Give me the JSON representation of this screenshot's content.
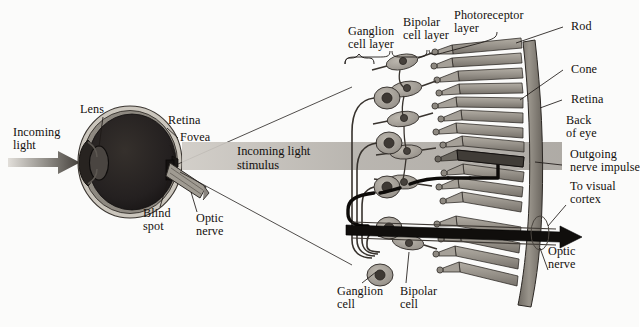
{
  "figure": {
    "background_color": "#fbfbfa",
    "ink_color": "#14100d"
  },
  "eye": {
    "labels": {
      "incoming_light": "Incoming\nlight",
      "lens": "Lens",
      "retina": "Retina",
      "fovea": "Fovea",
      "blind_spot": "Blind\nspot",
      "optic_nerve": "Optic\nnerve"
    },
    "colors": {
      "sclera": "#b9b4ab",
      "vitreous": "#231f1d",
      "lens_fill": "#3b3633",
      "nerve": "#8e8a80",
      "arrow_light": "#d8d5cf",
      "arrow_dark": "#4a4641"
    }
  },
  "stimulus": {
    "label": "Incoming light\nstimulus",
    "band_color": "#b6b2ac"
  },
  "retina_detail": {
    "layer_labels": [
      {
        "id": "ganglion-cell-layer",
        "text": "Ganglion\ncell layer"
      },
      {
        "id": "bipolar-cell-layer",
        "text": "Bipolar\ncell layer"
      },
      {
        "id": "photoreceptor-layer",
        "text": "Photoreceptor\nlayer"
      }
    ],
    "right_labels": [
      {
        "id": "rod",
        "text": "Rod"
      },
      {
        "id": "cone",
        "text": "Cone"
      },
      {
        "id": "retina",
        "text": "Retina"
      },
      {
        "id": "back-of-eye",
        "text": "Back\nof eye"
      },
      {
        "id": "outgoing-nerve-impulse",
        "text": "Outgoing\nnerve impulse"
      },
      {
        "id": "to-visual-cortex",
        "text": "To visual\ncortex"
      },
      {
        "id": "optic-nerve",
        "text": "Optic\nnerve"
      }
    ],
    "bottom_labels": [
      {
        "id": "ganglion-cell",
        "text": "Ganglion\ncell"
      },
      {
        "id": "bipolar-cell",
        "text": "Bipolar\ncell"
      }
    ],
    "colors": {
      "cell_fill": "#a9a49b",
      "nucleus": "#46413c",
      "photoreceptor_fill": "#9c978e",
      "wall": "#8d8880",
      "outline": "#2a2622",
      "highlight_path": "#0d0b09"
    },
    "counts": {
      "ganglion_cells": 5,
      "bipolar_cells": 6,
      "photoreceptors": 16
    }
  }
}
